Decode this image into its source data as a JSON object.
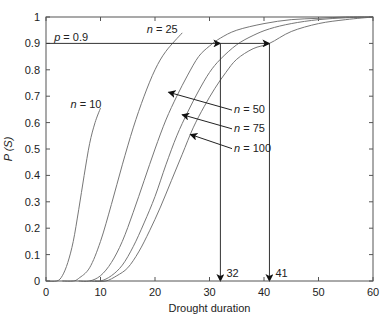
{
  "chart_data": {
    "type": "line",
    "title": "",
    "xlabel": "Drought duration",
    "ylabel": "P (S)",
    "xlim": [
      0,
      60
    ],
    "ylim": [
      0,
      1
    ],
    "xticks": [
      0,
      10,
      20,
      30,
      40,
      50,
      60
    ],
    "yticks": [
      0,
      0.1,
      0.2,
      0.3,
      0.4,
      0.5,
      0.6,
      0.7,
      0.8,
      0.9,
      1
    ],
    "grid": false,
    "series": [
      {
        "name": "n = 10",
        "x": [
          0,
          2,
          3,
          4,
          5,
          6,
          7,
          8,
          9,
          10
        ],
        "y": [
          0,
          0.0,
          0.02,
          0.07,
          0.15,
          0.27,
          0.4,
          0.52,
          0.6,
          0.655
        ]
      },
      {
        "name": "n = 25",
        "x": [
          3,
          5,
          6,
          8,
          10,
          12,
          14,
          16,
          18,
          20,
          22,
          25
        ],
        "y": [
          0,
          0.0,
          0.01,
          0.05,
          0.15,
          0.29,
          0.44,
          0.58,
          0.7,
          0.8,
          0.87,
          0.94
        ]
      },
      {
        "name": "n = 50",
        "x": [
          6,
          8,
          10,
          12,
          14,
          16,
          18,
          20,
          22,
          24,
          26,
          28,
          30,
          32,
          35,
          40,
          45,
          50,
          55,
          60
        ],
        "y": [
          0,
          0.0,
          0.02,
          0.07,
          0.15,
          0.26,
          0.38,
          0.5,
          0.61,
          0.7,
          0.78,
          0.85,
          0.89,
          0.92,
          0.95,
          0.975,
          0.99,
          0.995,
          1.0,
          1.0
        ]
      },
      {
        "name": "n = 75",
        "x": [
          8,
          10,
          12,
          14,
          16,
          18,
          20,
          22,
          24,
          26,
          28,
          30,
          32,
          35,
          38,
          41,
          45,
          50,
          55,
          60
        ],
        "y": [
          0,
          0.0,
          0.02,
          0.06,
          0.13,
          0.22,
          0.32,
          0.44,
          0.55,
          0.64,
          0.72,
          0.79,
          0.84,
          0.895,
          0.93,
          0.955,
          0.975,
          0.99,
          0.997,
          1.0
        ]
      },
      {
        "name": "n = 100",
        "x": [
          9,
          11,
          13,
          15,
          17,
          19,
          21,
          23,
          25,
          27,
          29,
          31,
          33,
          35,
          38,
          41,
          45,
          50,
          55,
          60
        ],
        "y": [
          0,
          0.0,
          0.02,
          0.05,
          0.11,
          0.19,
          0.28,
          0.38,
          0.48,
          0.58,
          0.66,
          0.73,
          0.79,
          0.84,
          0.88,
          0.9,
          0.945,
          0.975,
          0.99,
          1.0
        ]
      }
    ],
    "annotations": [
      {
        "text": "p = 0.9",
        "x": 1.5,
        "y": 0.91
      },
      {
        "text": "n = 10",
        "x": 4.5,
        "y": 0.655
      },
      {
        "text": "n = 25",
        "x": 18.5,
        "y": 0.94
      },
      {
        "text": "n = 50",
        "x": 34.5,
        "y": 0.636,
        "arrow_to": [
          22.5,
          0.715
        ]
      },
      {
        "text": "n = 75",
        "x": 34.5,
        "y": 0.565,
        "arrow_to": [
          25.0,
          0.63
        ]
      },
      {
        "text": "n = 100",
        "x": 34.5,
        "y": 0.49,
        "arrow_to": [
          26.5,
          0.555
        ]
      },
      {
        "text": "32",
        "x": 32,
        "y": 0
      },
      {
        "text": "41",
        "x": 41,
        "y": 0
      }
    ],
    "reference_lines": {
      "horizontal": {
        "y": 0.9,
        "x_from": 0,
        "x_to": 41
      },
      "verticals": [
        {
          "x": 32,
          "y_from": 0.9,
          "y_to": 0
        },
        {
          "x": 41,
          "y_from": 0.9,
          "y_to": 0
        }
      ]
    }
  }
}
